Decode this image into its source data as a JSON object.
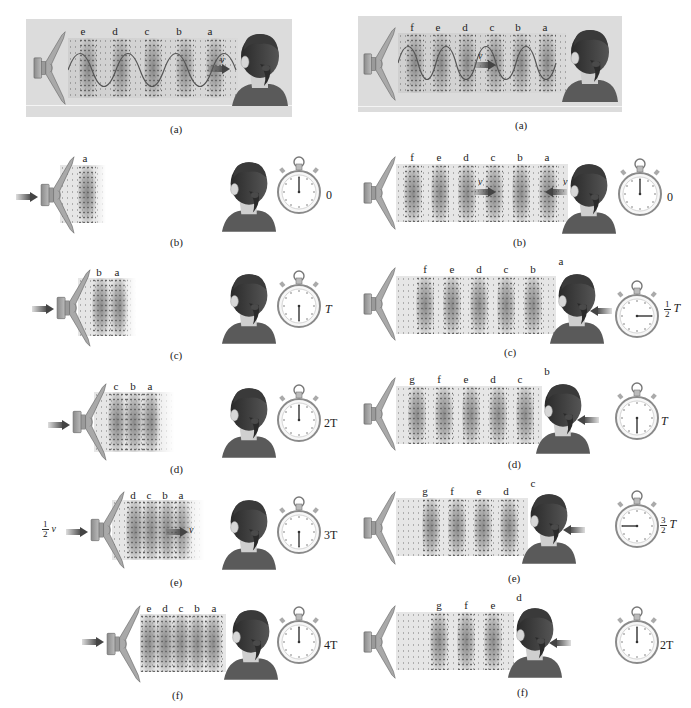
{
  "figure": {
    "colors": {
      "background": "#ffffff",
      "panel_gray": "#dcdcdc",
      "band_dark": "#6f6f6f",
      "arrow": "#555555",
      "text": "#222222"
    }
  },
  "left_column": {
    "panels": [
      {
        "caption": "(a)",
        "wavefront_labels": [
          "e",
          "d",
          "c",
          "b",
          "a"
        ],
        "velocity_label": "v",
        "stopwatch": null,
        "time_label": null
      },
      {
        "caption": "(b)",
        "wavefront_labels": [
          "a"
        ],
        "stopwatch": "hand-up",
        "time_label": "0"
      },
      {
        "caption": "(c)",
        "wavefront_labels": [
          "b",
          "a"
        ],
        "stopwatch": "hand-down",
        "time_label": "T"
      },
      {
        "caption": "(d)",
        "wavefront_labels": [
          "c",
          "b",
          "a"
        ],
        "stopwatch": "hand-up",
        "time_label": "2T"
      },
      {
        "caption": "(e)",
        "wavefront_labels": [
          "d",
          "c",
          "b",
          "a"
        ],
        "source_velocity_label": {
          "numerator": "1",
          "denominator": "2",
          "symbol": "v"
        },
        "wave_velocity_label": "v",
        "stopwatch": "hand-down",
        "time_label": "3T"
      },
      {
        "caption": "(f)",
        "wavefront_labels": [
          "e",
          "d",
          "c",
          "b",
          "a"
        ],
        "stopwatch": "hand-up",
        "time_label": "4T"
      }
    ]
  },
  "right_column": {
    "panels": [
      {
        "caption": "(a)",
        "wavefront_labels": [
          "f",
          "e",
          "d",
          "c",
          "b",
          "a"
        ],
        "velocity_label": "v",
        "stopwatch": null,
        "time_label": null
      },
      {
        "caption": "(b)",
        "wavefront_labels": [
          "f",
          "e",
          "d",
          "c",
          "b",
          "a"
        ],
        "wave_velocity_label": "v",
        "listener_velocity_label": "v",
        "stopwatch": "hand-up",
        "time_label": "0"
      },
      {
        "caption": "(c)",
        "wavefront_labels": [
          "f",
          "e",
          "d",
          "c",
          "b",
          "a"
        ],
        "stopwatch": "hand-right",
        "time_label": {
          "numerator": "1",
          "denominator": "2",
          "symbol": "T"
        }
      },
      {
        "caption": "(d)",
        "wavefront_labels": [
          "g",
          "f",
          "e",
          "d",
          "c",
          "b"
        ],
        "stopwatch": "hand-down",
        "time_label": "T"
      },
      {
        "caption": "(e)",
        "wavefront_labels": [
          "g",
          "f",
          "e",
          "d",
          "c"
        ],
        "stopwatch": "hand-left",
        "time_label": {
          "numerator": "3",
          "denominator": "2",
          "symbol": "T"
        }
      },
      {
        "caption": "(f)",
        "wavefront_labels": [
          "g",
          "f",
          "e",
          "d"
        ],
        "stopwatch": "hand-up",
        "time_label": "2T"
      }
    ]
  }
}
